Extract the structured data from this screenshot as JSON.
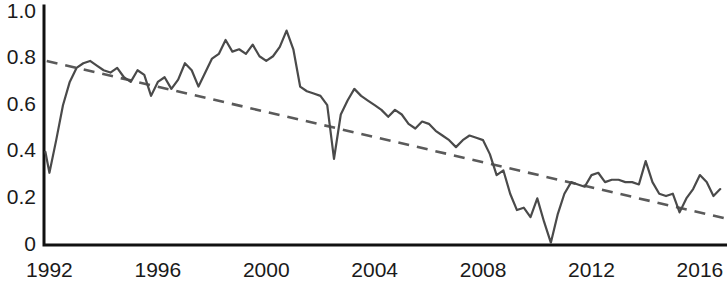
{
  "chart_data": {
    "type": "line",
    "title": "",
    "subtitle": "",
    "xlabel": "",
    "ylabel": "",
    "xlim": [
      1991.8,
      2017.0
    ],
    "ylim": [
      0,
      1.0
    ],
    "grid": false,
    "legend": null,
    "y_ticks": [
      "1.0",
      "0.8",
      "0.6",
      "0.4",
      "0.2",
      "0"
    ],
    "y_tick_values": [
      1.0,
      0.8,
      0.6,
      0.4,
      0.2,
      0
    ],
    "x_ticks": [
      "1992",
      "1996",
      "2000",
      "2004",
      "2008",
      "2012",
      "2016"
    ],
    "x_tick_values": [
      1992,
      1996,
      2000,
      2004,
      2008,
      2012,
      2016
    ],
    "series": [
      {
        "name": "observed",
        "style": "solid",
        "color": "#4a4a4a",
        "x": [
          1991.85,
          1992.0,
          1992.25,
          1992.5,
          1992.75,
          1993.0,
          1993.25,
          1993.5,
          1993.75,
          1994.0,
          1994.25,
          1994.5,
          1994.75,
          1995.0,
          1995.25,
          1995.5,
          1995.75,
          1996.0,
          1996.25,
          1996.5,
          1996.75,
          1997.0,
          1997.25,
          1997.5,
          1997.75,
          1998.0,
          1998.25,
          1998.5,
          1998.75,
          1999.0,
          1999.25,
          1999.5,
          1999.75,
          2000.0,
          2000.25,
          2000.5,
          2000.75,
          2001.0,
          2001.25,
          2001.5,
          2001.75,
          2002.0,
          2002.25,
          2002.5,
          2002.75,
          2003.0,
          2003.25,
          2003.5,
          2003.75,
          2004.0,
          2004.25,
          2004.5,
          2004.75,
          2005.0,
          2005.25,
          2005.5,
          2005.75,
          2006.0,
          2006.25,
          2006.5,
          2006.75,
          2007.0,
          2007.25,
          2007.5,
          2007.75,
          2008.0,
          2008.25,
          2008.5,
          2008.75,
          2009.0,
          2009.25,
          2009.5,
          2009.75,
          2010.0,
          2010.25,
          2010.5,
          2010.75,
          2011.0,
          2011.25,
          2011.5,
          2011.75,
          2012.0,
          2012.25,
          2012.5,
          2012.75,
          2013.0,
          2013.25,
          2013.5,
          2013.75,
          2014.0,
          2014.25,
          2014.5,
          2014.75,
          2015.0,
          2015.25,
          2015.5,
          2015.75,
          2016.0,
          2016.25,
          2016.5,
          2016.75
        ],
        "y": [
          0.4,
          0.31,
          0.45,
          0.6,
          0.7,
          0.76,
          0.78,
          0.79,
          0.77,
          0.75,
          0.74,
          0.76,
          0.72,
          0.7,
          0.75,
          0.73,
          0.64,
          0.7,
          0.72,
          0.67,
          0.71,
          0.78,
          0.75,
          0.68,
          0.74,
          0.8,
          0.82,
          0.88,
          0.83,
          0.84,
          0.82,
          0.86,
          0.81,
          0.79,
          0.81,
          0.85,
          0.92,
          0.84,
          0.68,
          0.66,
          0.65,
          0.64,
          0.6,
          0.37,
          0.56,
          0.62,
          0.67,
          0.64,
          0.62,
          0.6,
          0.58,
          0.55,
          0.58,
          0.56,
          0.52,
          0.5,
          0.53,
          0.52,
          0.49,
          0.47,
          0.45,
          0.42,
          0.45,
          0.47,
          0.46,
          0.45,
          0.39,
          0.3,
          0.32,
          0.22,
          0.15,
          0.16,
          0.12,
          0.2,
          0.1,
          0.01,
          0.13,
          0.22,
          0.27,
          0.26,
          0.25,
          0.3,
          0.31,
          0.27,
          0.28,
          0.28,
          0.27,
          0.27,
          0.26,
          0.36,
          0.27,
          0.22,
          0.21,
          0.22,
          0.14,
          0.2,
          0.24,
          0.3,
          0.27,
          0.21,
          0.24
        ]
      },
      {
        "name": "trend",
        "style": "dashed",
        "color": "#5a5a5a",
        "x": [
          1991.9,
          2016.9
        ],
        "y": [
          0.79,
          0.115
        ]
      }
    ]
  },
  "axes": {
    "y_axis_name": "y-axis",
    "x_axis_name": "x-axis"
  }
}
